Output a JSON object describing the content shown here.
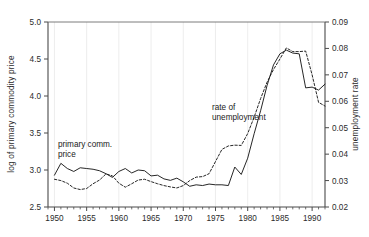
{
  "chart_data": {
    "type": "line",
    "title": "",
    "xlabel": "",
    "ylabel": "log of primary commodity price",
    "y2label": "unemployment rate",
    "xlim": [
      1949,
      1992
    ],
    "ylim": [
      2.5,
      5.0
    ],
    "y2lim": [
      0.02,
      0.09
    ],
    "grid": "vertical-major-faint",
    "legend_position": "inline-annotations",
    "xticks": [
      1950,
      1955,
      1960,
      1965,
      1970,
      1975,
      1980,
      1985,
      1990
    ],
    "xtick_labels": [
      "1950",
      "1955",
      "1960",
      "1965",
      "1970",
      "1975",
      "1980",
      "1985",
      "1990"
    ],
    "xminor_step": 1,
    "yticks": [
      2.5,
      3.0,
      3.5,
      4.0,
      4.5,
      5.0
    ],
    "ytick_labels": [
      "2.5",
      "3.0",
      "3.5",
      "4.0",
      "4.5",
      "5.0"
    ],
    "y2ticks": [
      0.02,
      0.03,
      0.04,
      0.05,
      0.06,
      0.07,
      0.08,
      0.09
    ],
    "y2tick_labels": [
      "0.02",
      "0.03",
      "0.04",
      "0.05",
      "0.06",
      "0.07",
      "0.08",
      "0.09"
    ],
    "annotations": [
      {
        "text": "primary comm. price",
        "x": 1951.2,
        "y_axis": "left",
        "y": 3.27
      },
      {
        "text": "rate of unemployment",
        "x": 1975.6,
        "y_axis": "left",
        "y": 3.76
      }
    ],
    "series": [
      {
        "name": "primary comm. price",
        "axis": "left",
        "style": "solid",
        "color": "#1a1a1a",
        "x": [
          1950,
          1951,
          1952,
          1953,
          1954,
          1955,
          1956,
          1957,
          1958,
          1959,
          1960,
          1961,
          1962,
          1963,
          1964,
          1965,
          1966,
          1967,
          1968,
          1969,
          1970,
          1971,
          1972,
          1973,
          1974,
          1975,
          1976,
          1977,
          1978,
          1979,
          1980,
          1981,
          1982,
          1983,
          1984,
          1985,
          1986,
          1987,
          1988,
          1989,
          1990,
          1991,
          1992
        ],
        "y": [
          2.93,
          3.09,
          3.02,
          2.98,
          3.03,
          3.02,
          3.01,
          2.99,
          2.95,
          2.9,
          2.98,
          3.02,
          2.96,
          3.0,
          2.99,
          2.92,
          2.93,
          2.88,
          2.86,
          2.89,
          2.84,
          2.78,
          2.8,
          2.79,
          2.81,
          2.8,
          2.8,
          2.79,
          3.04,
          2.94,
          3.16,
          3.49,
          3.8,
          4.14,
          4.42,
          4.57,
          4.62,
          4.58,
          4.57,
          4.11,
          4.12,
          4.08,
          4.16
        ],
        "y_note": "left-axis log of primary commodity price"
      },
      {
        "name": "rate of unemployment",
        "axis": "right",
        "style": "dashed",
        "color": "#1a1a1a",
        "x": [
          1950,
          1951,
          1952,
          1953,
          1954,
          1955,
          1956,
          1957,
          1958,
          1959,
          1960,
          1961,
          1962,
          1963,
          1964,
          1965,
          1966,
          1967,
          1968,
          1969,
          1970,
          1971,
          1972,
          1973,
          1974,
          1975,
          1976,
          1977,
          1978,
          1979,
          1980,
          1981,
          1982,
          1983,
          1984,
          1985,
          1986,
          1987,
          1988,
          1989,
          1990,
          1991,
          1992
        ],
        "y": [
          0.0305,
          0.03,
          0.029,
          0.0272,
          0.0266,
          0.027,
          0.0288,
          0.0302,
          0.0325,
          0.0318,
          0.029,
          0.0275,
          0.0288,
          0.0302,
          0.0305,
          0.0296,
          0.0288,
          0.0281,
          0.0276,
          0.0272,
          0.0281,
          0.03,
          0.0313,
          0.0315,
          0.0326,
          0.0372,
          0.0418,
          0.0431,
          0.0434,
          0.0433,
          0.0478,
          0.054,
          0.061,
          0.0672,
          0.072,
          0.076,
          0.0802,
          0.0788,
          0.0788,
          0.079,
          0.07,
          0.0596,
          0.0582
        ],
        "y_note": "right-axis unemployment rate (fraction)"
      }
    ]
  },
  "axes": {
    "left_title": "log of primary commodity price",
    "right_title": "unemployment rate"
  },
  "annotations": {
    "commodity_line1": "primary comm.",
    "commodity_line2": "price",
    "unemployment_line1": "rate of",
    "unemployment_line2": "unemployment"
  }
}
